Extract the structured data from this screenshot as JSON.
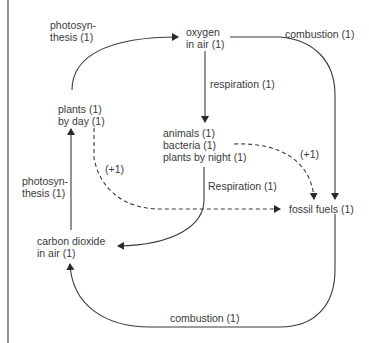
{
  "diagram": {
    "nodes": {
      "oxygen": {
        "lines": [
          "oxygen",
          "in air (1)"
        ]
      },
      "plants_day": {
        "lines": [
          "plants (1)",
          "by day (1)"
        ]
      },
      "respirers": {
        "lines": [
          "animals (1)",
          "bacteria (1)",
          "plants by night (1)"
        ]
      },
      "fossil_fuels": {
        "lines": [
          "fossil fuels (1)"
        ]
      },
      "carbon_dioxide": {
        "lines": [
          "carbon dioxide",
          "in air (1)"
        ]
      }
    },
    "edges": {
      "photosynthesis_top": {
        "lines": [
          "photosyn-",
          "thesis (1)"
        ],
        "from": "plants_day",
        "to": "oxygen",
        "style": "solid"
      },
      "combustion_top": {
        "lines": [
          "combustion (1)"
        ],
        "from": "oxygen",
        "to": "fossil_fuels",
        "style": "solid"
      },
      "respiration_down": {
        "lines": [
          "respiration (1)"
        ],
        "from": "oxygen",
        "to": "respirers",
        "style": "solid"
      },
      "plus_one_right": {
        "lines": [
          "(+1)"
        ],
        "from": "respirers",
        "to": "fossil_fuels",
        "style": "dashed"
      },
      "plus_one_left": {
        "lines": [
          "(+1)"
        ],
        "from": "plants_day",
        "to": "fossil_fuels",
        "style": "dashed"
      },
      "photosynthesis_left": {
        "lines": [
          "photosyn-",
          "thesis (1)"
        ],
        "from": "carbon_dioxide",
        "to": "plants_day",
        "style": "solid"
      },
      "respiration_co2": {
        "lines": [
          "Respiration (1)"
        ],
        "from": "respirers",
        "to": "carbon_dioxide",
        "style": "solid"
      },
      "combustion_bottom": {
        "lines": [
          "combustion (1)"
        ],
        "from": "fossil_fuels",
        "to": "carbon_dioxide",
        "style": "solid"
      }
    },
    "colors": {
      "ink": "#3a3a3a",
      "background": "#ffffff"
    }
  }
}
